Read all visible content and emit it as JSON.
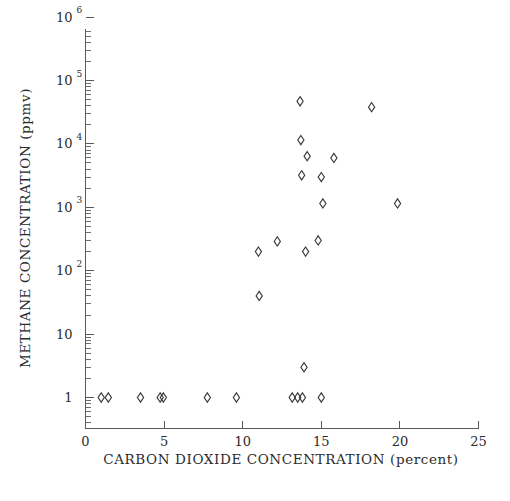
{
  "chart_data": {
    "type": "scatter",
    "title": "",
    "xlabel": "CARBON DIOXIDE CONCENTRATION (percent)",
    "ylabel": "METHANE CONCENTRATION (ppmv)",
    "xlim": [
      0,
      25
    ],
    "ylim": [
      1,
      1000000
    ],
    "yscale": "log",
    "xscale": "linear",
    "grid": false,
    "legend": null,
    "marker": "open-diamond",
    "xticks": [
      0,
      5,
      10,
      15,
      20,
      25
    ],
    "xtick_labels": [
      "0",
      "5",
      "10",
      "15",
      "20",
      "25"
    ],
    "yticks": [
      1,
      10,
      100,
      1000,
      10000,
      100000,
      1000000
    ],
    "ytick_labels": [
      "1",
      "10",
      "10 2",
      "10 3",
      "10 4",
      "10 5",
      "10 6"
    ],
    "ytick_mantissa": [
      "1",
      "10",
      "10",
      "10",
      "10",
      "10",
      "10"
    ],
    "ytick_exponent": [
      "",
      "",
      "2",
      "3",
      "4",
      "5",
      "6"
    ],
    "points": [
      {
        "x": 1.0,
        "y": 1
      },
      {
        "x": 1.45,
        "y": 1
      },
      {
        "x": 3.5,
        "y": 1
      },
      {
        "x": 4.75,
        "y": 1
      },
      {
        "x": 4.95,
        "y": 1
      },
      {
        "x": 7.75,
        "y": 1
      },
      {
        "x": 9.6,
        "y": 1
      },
      {
        "x": 13.15,
        "y": 1
      },
      {
        "x": 13.5,
        "y": 1
      },
      {
        "x": 13.8,
        "y": 1
      },
      {
        "x": 15.0,
        "y": 1
      },
      {
        "x": 13.9,
        "y": 3.0
      },
      {
        "x": 11.05,
        "y": 40
      },
      {
        "x": 11.0,
        "y": 200
      },
      {
        "x": 12.2,
        "y": 290
      },
      {
        "x": 14.0,
        "y": 200
      },
      {
        "x": 14.8,
        "y": 300
      },
      {
        "x": 15.1,
        "y": 1150
      },
      {
        "x": 19.85,
        "y": 1150
      },
      {
        "x": 13.75,
        "y": 3200
      },
      {
        "x": 15.0,
        "y": 3000
      },
      {
        "x": 14.1,
        "y": 6400
      },
      {
        "x": 15.8,
        "y": 6000
      },
      {
        "x": 13.7,
        "y": 11500
      },
      {
        "x": 13.65,
        "y": 47000
      },
      {
        "x": 18.2,
        "y": 38000
      }
    ]
  },
  "axis": {
    "x_title": "CARBON DIOXIDE CONCENTRATION (percent)",
    "y_title": "METHANE CONCENTRATION (ppmv)"
  }
}
